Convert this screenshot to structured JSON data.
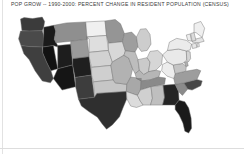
{
  "title": "POP GROW -- 1990-2000: PERCENT CHANGE IN RESIDENT POPULATION (CENSUS)",
  "chart_data": {
    "type": "map",
    "subtype": "choropleth",
    "title": "POP GROW -- 1990-2000: PERCENT CHANGE IN RESIDENT POPULATION (CENSUS)",
    "variable": "POP GROW",
    "period": "1990-2000",
    "units": "percent change in resident population",
    "source": "CENSUS",
    "region": "United States (lower 48)",
    "legend": {
      "visible": false,
      "position": "none"
    },
    "grid": false,
    "colormap": "grayscale",
    "colormap_direction": "dark = high growth, light = low growth",
    "bins": [
      {
        "label": "very high",
        "fill": "#141414"
      },
      {
        "label": "high",
        "fill": "#3b3b3b"
      },
      {
        "label": "medium",
        "fill": "#8d8d8d"
      },
      {
        "label": "low",
        "fill": "#c9c9c9"
      },
      {
        "label": "very low",
        "fill": "#efefef"
      }
    ],
    "states": [
      {
        "code": "WA",
        "name": "Washington",
        "bin": "high",
        "fill": "#3b3b3b"
      },
      {
        "code": "OR",
        "name": "Oregon",
        "bin": "high",
        "fill": "#4a4a4a"
      },
      {
        "code": "CA",
        "name": "California",
        "bin": "high",
        "fill": "#3f3f3f"
      },
      {
        "code": "ID",
        "name": "Idaho",
        "bin": "very high",
        "fill": "#1b1b1b"
      },
      {
        "code": "NV",
        "name": "Nevada",
        "bin": "very high",
        "fill": "#121212"
      },
      {
        "code": "UT",
        "name": "Utah",
        "bin": "very high",
        "fill": "#1d1d1d"
      },
      {
        "code": "AZ",
        "name": "Arizona",
        "bin": "very high",
        "fill": "#151515"
      },
      {
        "code": "MT",
        "name": "Montana",
        "bin": "medium",
        "fill": "#8f8f8f"
      },
      {
        "code": "WY",
        "name": "Wyoming",
        "bin": "medium",
        "fill": "#9a9a9a"
      },
      {
        "code": "CO",
        "name": "Colorado",
        "bin": "very high",
        "fill": "#1f1f1f"
      },
      {
        "code": "NM",
        "name": "New Mexico",
        "bin": "high",
        "fill": "#3d3d3d"
      },
      {
        "code": "ND",
        "name": "North Dakota",
        "bin": "very low",
        "fill": "#f0f0f0"
      },
      {
        "code": "SD",
        "name": "South Dakota",
        "bin": "low",
        "fill": "#dedede"
      },
      {
        "code": "NE",
        "name": "Nebraska",
        "bin": "low",
        "fill": "#d2d2d2"
      },
      {
        "code": "KS",
        "name": "Kansas",
        "bin": "low",
        "fill": "#cfcfcf"
      },
      {
        "code": "OK",
        "name": "Oklahoma",
        "bin": "low",
        "fill": "#c6c6c6"
      },
      {
        "code": "TX",
        "name": "Texas",
        "bin": "high",
        "fill": "#2f2f2f"
      },
      {
        "code": "MN",
        "name": "Minnesota",
        "bin": "medium",
        "fill": "#959595"
      },
      {
        "code": "IA",
        "name": "Iowa",
        "bin": "low",
        "fill": "#d8d8d8"
      },
      {
        "code": "MO",
        "name": "Missouri",
        "bin": "medium",
        "fill": "#b2b2b2"
      },
      {
        "code": "AR",
        "name": "Arkansas",
        "bin": "medium",
        "fill": "#a8a8a8"
      },
      {
        "code": "LA",
        "name": "Louisiana",
        "bin": "low",
        "fill": "#dcdcdc"
      },
      {
        "code": "WI",
        "name": "Wisconsin",
        "bin": "medium",
        "fill": "#9e9e9e"
      },
      {
        "code": "IL",
        "name": "Illinois",
        "bin": "medium",
        "fill": "#bdbdbd"
      },
      {
        "code": "MI",
        "name": "Michigan",
        "bin": "low",
        "fill": "#cdcdcd"
      },
      {
        "code": "IN",
        "name": "Indiana",
        "bin": "low",
        "fill": "#cacaca"
      },
      {
        "code": "OH",
        "name": "Ohio",
        "bin": "low",
        "fill": "#d6d6d6"
      },
      {
        "code": "KY",
        "name": "Kentucky",
        "bin": "medium",
        "fill": "#b6b6b6"
      },
      {
        "code": "TN",
        "name": "Tennessee",
        "bin": "medium",
        "fill": "#8a8a8a"
      },
      {
        "code": "MS",
        "name": "Mississippi",
        "bin": "low",
        "fill": "#d0d0d0"
      },
      {
        "code": "AL",
        "name": "Alabama",
        "bin": "medium",
        "fill": "#bfbfbf"
      },
      {
        "code": "GA",
        "name": "Georgia",
        "bin": "very high",
        "fill": "#242424"
      },
      {
        "code": "FL",
        "name": "Florida",
        "bin": "very high",
        "fill": "#1a1a1a"
      },
      {
        "code": "SC",
        "name": "South Carolina",
        "bin": "medium",
        "fill": "#8b8b8b"
      },
      {
        "code": "NC",
        "name": "North Carolina",
        "bin": "high",
        "fill": "#474747"
      },
      {
        "code": "VA",
        "name": "Virginia",
        "bin": "medium",
        "fill": "#9d9d9d"
      },
      {
        "code": "WV",
        "name": "West Virginia",
        "bin": "very low",
        "fill": "#ededed"
      },
      {
        "code": "MD",
        "name": "Maryland",
        "bin": "low",
        "fill": "#c4c4c4"
      },
      {
        "code": "DE",
        "name": "Delaware",
        "bin": "medium",
        "fill": "#b0b0b0"
      },
      {
        "code": "PA",
        "name": "Pennsylvania",
        "bin": "very low",
        "fill": "#e9e9e9"
      },
      {
        "code": "NJ",
        "name": "New Jersey",
        "bin": "low",
        "fill": "#d4d4d4"
      },
      {
        "code": "NY",
        "name": "New York",
        "bin": "very low",
        "fill": "#ebebeb"
      },
      {
        "code": "CT",
        "name": "Connecticut",
        "bin": "very low",
        "fill": "#e6e6e6"
      },
      {
        "code": "RI",
        "name": "Rhode Island",
        "bin": "very low",
        "fill": "#eaeaea"
      },
      {
        "code": "MA",
        "name": "Massachusetts",
        "bin": "very low",
        "fill": "#e4e4e4"
      },
      {
        "code": "VT",
        "name": "Vermont",
        "bin": "very low",
        "fill": "#ededed"
      },
      {
        "code": "NH",
        "name": "New Hampshire",
        "bin": "low",
        "fill": "#dbdbdb"
      },
      {
        "code": "ME",
        "name": "Maine",
        "bin": "very low",
        "fill": "#efefef"
      }
    ]
  }
}
